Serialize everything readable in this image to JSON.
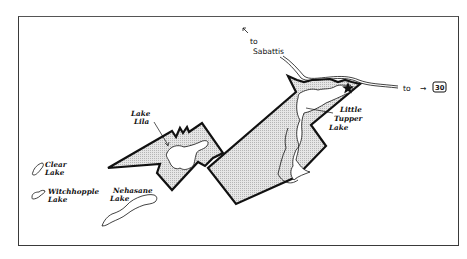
{
  "map": {
    "labels": {
      "to_sabattis_line1": "to",
      "to_sabattis_line2": "Sabattis",
      "to_route": "to",
      "route_arrow": "→",
      "route_number": "30",
      "little_tupper_line1": "Little",
      "little_tupper_line2": "Tupper",
      "little_tupper_line3": "Lake",
      "lake_lila_line1": "Lake",
      "lake_lila_line2": "Lila",
      "clear_lake_line1": "Clear",
      "clear_lake_line2": "Lake",
      "witchhopple_line1": "Witchhopple",
      "witchhopple_line2": "Lake",
      "nehasane_line1": "Nehasane",
      "nehasane_line2": "Lake"
    },
    "features": {
      "parcels": [
        "west-parcel",
        "east-parcel"
      ],
      "lakes": [
        "Little Tupper Lake",
        "Lake Lila",
        "Clear Lake",
        "Witchhopple Lake",
        "Nehasane Lake"
      ],
      "road": "road to Sabattis and Route 30",
      "marker": "star-icon"
    },
    "colors": {
      "outline": "#111111",
      "parcel_fill": "#d9d9d9",
      "lake_fill": "#ffffff",
      "frame": "#3a3a3a"
    }
  }
}
